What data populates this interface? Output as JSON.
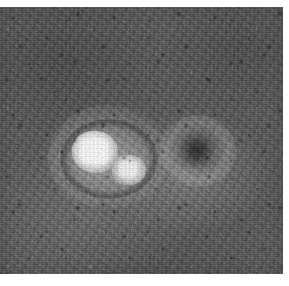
{
  "caption": {
    "credit_text": "Image by Keith Matthews and Gary Hodgson, Caltech"
  },
  "image": {
    "alt_label": "grayscale astronomical plate",
    "description": "Noisy grayscale astronomical exposure showing a bright double source at left of centre and a dark compact source to its right",
    "background_color": "#555555",
    "core_color": "#fdfdfd",
    "dark_source_color": "#1a1a1a",
    "page_background": "#ffffff",
    "features": [
      {
        "name": "primary-source",
        "kind": "bright",
        "label": "primary bright source"
      },
      {
        "name": "secondary-source",
        "kind": "bright",
        "label": "secondary bright source"
      },
      {
        "name": "dark-source",
        "kind": "dark",
        "label": "dark compact source"
      }
    ]
  }
}
